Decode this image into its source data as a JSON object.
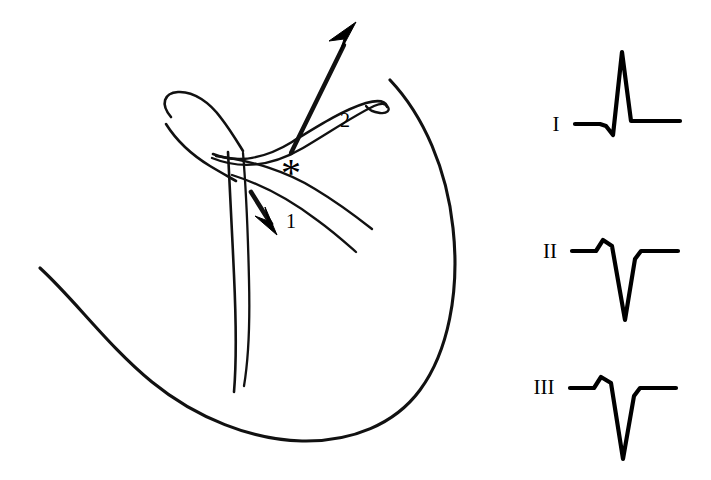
{
  "figure": {
    "kind": "anatomical-line-drawing-with-ecg",
    "background_color": "#ffffff",
    "ink_color": "#000000"
  },
  "anatomy": {
    "panel_name": "cardiac-chamber-line-drawing",
    "markers": [
      {
        "id": "asterisk",
        "glyph": "*",
        "name": "site-asterisk",
        "x": 291,
        "y": 172
      },
      {
        "id": "label-1",
        "text": "1",
        "name": "direction-label-1",
        "x": 286,
        "y": 228
      },
      {
        "id": "label-2",
        "text": "2",
        "name": "direction-label-2",
        "x": 340,
        "y": 127
      }
    ],
    "arrows": [
      {
        "id": "arrow-1",
        "name": "downward-arrow",
        "direction": "down-left",
        "label": "1"
      },
      {
        "id": "arrow-2",
        "name": "upward-arrow",
        "direction": "up-right",
        "label": "2"
      }
    ]
  },
  "ecg": {
    "panel_name": "ecg-leads-panel",
    "leads": [
      {
        "name": "I",
        "label": "I",
        "label_x": 556,
        "label_y": 131,
        "baseline_y": 124,
        "morphology": "small q, tall positive R, return to baseline",
        "polarity": "positive",
        "points": "575,124 600,124 606,126 613,135 622,52 631,121 638,121 680,121"
      },
      {
        "name": "II",
        "label": "II",
        "label_x": 548,
        "label_y": 258,
        "baseline_y": 251,
        "morphology": "small r, deep wide S (predominantly negative QS)",
        "polarity": "negative",
        "points": "572,251 596,251 603,240 612,246 625,320 635,259 641,251 678,251"
      },
      {
        "name": "III",
        "label": "III",
        "label_x": 540,
        "label_y": 394,
        "baseline_y": 388,
        "morphology": "small r, deep wide S (predominantly negative QS)",
        "polarity": "negative",
        "points": "570,388 594,388 601,377 611,383 623,459 634,396 640,388 676,388"
      }
    ]
  }
}
